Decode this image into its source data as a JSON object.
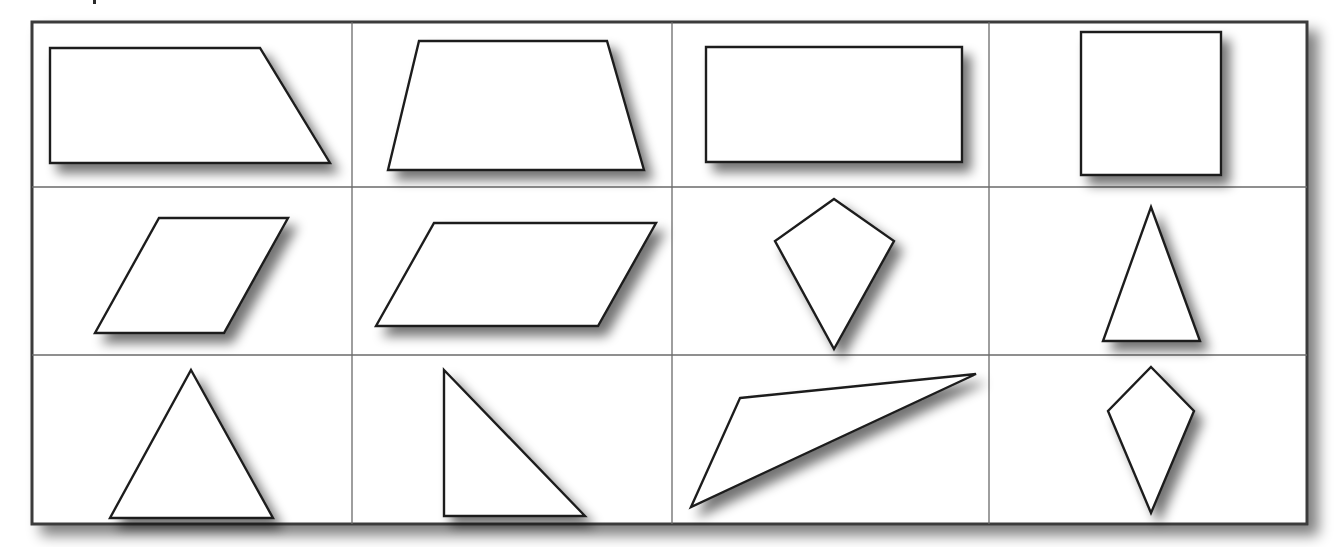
{
  "figure": {
    "frame": {
      "x": 32,
      "y": 22,
      "width": 1275,
      "height": 502
    },
    "columns_x": [
      32,
      352,
      672,
      989,
      1307
    ],
    "rows_y": [
      22,
      187,
      355,
      524
    ],
    "colors": {
      "frame_stroke": "#3a3a3a",
      "grid_stroke": "#6a6a6a",
      "shape_stroke": "#1e1e1e",
      "shape_fill": "#ffffff",
      "shadow": "#8a8a8a",
      "background": "#ffffff"
    },
    "shapes": [
      {
        "name": "right-trapezoid",
        "row": 1,
        "col": 1,
        "points": "50,48 260,48 330,163 50,163"
      },
      {
        "name": "isosceles-trapezoid",
        "row": 1,
        "col": 2,
        "points": "419,41 607,41 644,170 388,170"
      },
      {
        "name": "rectangle",
        "row": 1,
        "col": 3,
        "points": "706,47 962,47 962,162 706,162"
      },
      {
        "name": "square",
        "row": 1,
        "col": 4,
        "points": "1081,32 1221,32 1221,175 1081,175"
      },
      {
        "name": "rhombus",
        "row": 2,
        "col": 1,
        "points": "159,218 288,218 224,333 95,333"
      },
      {
        "name": "parallelogram",
        "row": 2,
        "col": 2,
        "points": "434,223 656,223 598,326 376,326"
      },
      {
        "name": "kite",
        "row": 2,
        "col": 3,
        "points": "834,199 894,241 834,349 775,241"
      },
      {
        "name": "isosceles-triangle",
        "row": 2,
        "col": 4,
        "points": "1151,207 1200,341 1103,341"
      },
      {
        "name": "equilateral-triangle",
        "row": 3,
        "col": 1,
        "points": "191,370 273,518 110,518"
      },
      {
        "name": "right-triangle",
        "row": 3,
        "col": 2,
        "points": "444,370 585,516 444,516"
      },
      {
        "name": "obtuse-scalene-triangle",
        "row": 3,
        "col": 3,
        "points": "740,398 976,374 691,507"
      },
      {
        "name": "small-kite",
        "row": 3,
        "col": 4,
        "points": "1151,367 1194,411 1151,513 1108,411"
      }
    ]
  }
}
